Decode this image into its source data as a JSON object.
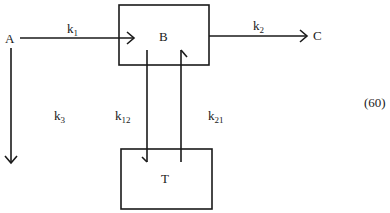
{
  "diagram": {
    "type": "compartment-model",
    "equation_number": "(60)",
    "nodes": [
      {
        "id": "A",
        "label": "A",
        "boxed": false
      },
      {
        "id": "B",
        "label": "B",
        "boxed": true
      },
      {
        "id": "C",
        "label": "C",
        "boxed": false
      },
      {
        "id": "T",
        "label": "T",
        "boxed": true
      }
    ],
    "edges": [
      {
        "from": "A",
        "to": "B",
        "rate": "k",
        "sub": "1"
      },
      {
        "from": "B",
        "to": "C",
        "rate": "k",
        "sub": "2"
      },
      {
        "from": "A",
        "to": "elimination",
        "rate": "k",
        "sub": "3"
      },
      {
        "from": "B",
        "to": "T",
        "rate": "k",
        "sub": "12"
      },
      {
        "from": "T",
        "to": "B",
        "rate": "k",
        "sub": "21"
      }
    ]
  }
}
